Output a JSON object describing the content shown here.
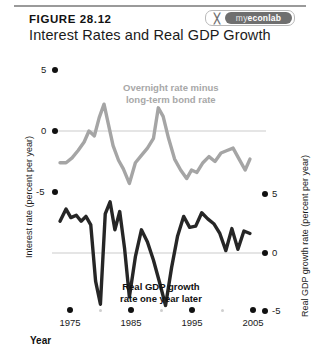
{
  "header": {
    "figure_number": "FIGURE 28.12",
    "title": "Interest Rates and Real GDP Growth",
    "badge": {
      "mark": "╳",
      "prefix": "my",
      "name": "econlab"
    }
  },
  "axes": {
    "left": {
      "label": "Interest rate (percent per year)",
      "ticks": [
        "5",
        "0",
        "-5"
      ]
    },
    "right": {
      "label": "Real GDP growth rate (percent per year)",
      "ticks": [
        "5",
        "0",
        "-5"
      ]
    },
    "x": {
      "title": "Year",
      "ticks": [
        "1975",
        "1985",
        "1995",
        "2005"
      ]
    }
  },
  "annotations": {
    "gray_series": "Overnight rate minus\nlong-term bond rate",
    "gray_series_line1": "Overnight rate minus",
    "gray_series_line2": "long-term bond rate",
    "black_series_line1": "Real GDP growth",
    "black_series_line2": "rate one year later"
  },
  "colors": {
    "gray_series": "#a5a5a5",
    "black_series": "#262626",
    "gridline": "#dcdcdc",
    "axis_dot": "#111111",
    "rule": "#9a9a9a"
  },
  "chart_data": {
    "type": "line",
    "title": "Interest Rates and Real GDP Growth",
    "xlabel": "Year",
    "ylabel": "Interest rate (percent per year)",
    "ylabel_right": "Real GDP growth rate (percent per year)",
    "xlim": [
      1973,
      2006
    ],
    "ylim": [
      -7.5,
      6.5
    ],
    "ylim_right": [
      -7.5,
      6.5
    ],
    "grid": false,
    "zero_gridlines": [
      0,
      0
    ],
    "legend": "annotations",
    "series": [
      {
        "name": "Overnight rate minus long-term bond rate",
        "axis": "left",
        "color": "#a5a5a5",
        "x": [
          1973.5,
          1974.5,
          1975.5,
          1976.5,
          1977.5,
          1978.3,
          1979.2,
          1980.0,
          1980.8,
          1981.5,
          1982.3,
          1983.2,
          1984.0,
          1985.0,
          1986.0,
          1987.0,
          1988.0,
          1989.0,
          1989.8,
          1990.6,
          1991.5,
          1992.5,
          1993.5,
          1994.5,
          1995.3,
          1996.2,
          1997.2,
          1998.2,
          1999.2,
          2000.2,
          2001.2,
          2002.2,
          2003.2,
          2004.2,
          2005.0
        ],
        "y": [
          -2.6,
          -2.6,
          -2.2,
          -1.6,
          -0.9,
          0.0,
          -0.4,
          1.1,
          2.2,
          0.6,
          -1.2,
          -2.4,
          -3.1,
          -4.3,
          -2.6,
          -2.0,
          -1.4,
          -0.6,
          1.9,
          1.2,
          -0.6,
          -2.3,
          -3.2,
          -3.9,
          -3.2,
          -3.4,
          -2.6,
          -2.1,
          -2.5,
          -1.8,
          -1.6,
          -1.4,
          -2.3,
          -3.2,
          -2.3
        ]
      },
      {
        "name": "Real GDP growth rate one year later",
        "axis": "right",
        "color": "#262626",
        "x": [
          1973.5,
          1974.5,
          1975.3,
          1976.2,
          1977.0,
          1977.8,
          1978.6,
          1979.4,
          1980.2,
          1981.0,
          1981.8,
          1982.6,
          1983.4,
          1984.2,
          1985.0,
          1986.0,
          1987.0,
          1988.0,
          1989.0,
          1990.0,
          1991.0,
          1992.0,
          1993.0,
          1994.0,
          1995.0,
          1996.0,
          1997.0,
          1998.0,
          1999.0,
          2000.0,
          2001.0,
          2002.0,
          2003.0,
          2004.0,
          2005.0
        ],
        "y": [
          2.6,
          3.6,
          2.9,
          3.1,
          2.6,
          3.0,
          2.3,
          -2.3,
          -4.2,
          3.2,
          4.2,
          1.9,
          3.4,
          0.4,
          -3.6,
          -0.3,
          1.9,
          0.9,
          -0.6,
          -2.4,
          -4.3,
          -1.2,
          1.4,
          3.0,
          2.1,
          2.2,
          3.3,
          2.8,
          2.4,
          1.6,
          0.2,
          2.0,
          0.3,
          1.8,
          1.6
        ]
      }
    ],
    "x_minor_ticks": [
      1980,
      1990,
      2000
    ],
    "right_axis_offset_note": "right axis zero is drawn 2 scale-units below left axis zero"
  }
}
